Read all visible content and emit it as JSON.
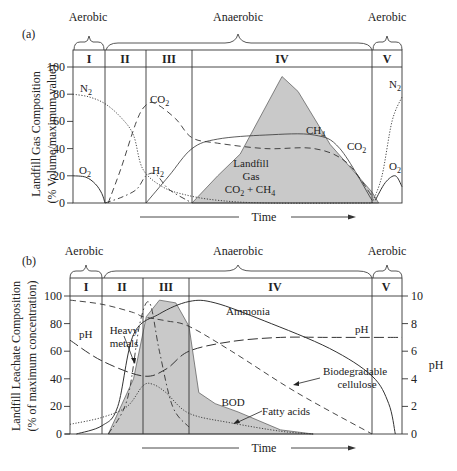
{
  "chart_data": [
    {
      "type": "line",
      "panel_label": "(a)",
      "title": "",
      "xlabel": "Time",
      "ylabel": "Landfill Gas Composition",
      "ylabel_sub": "(% Volume/maximum value)",
      "ylim": [
        0,
        100
      ],
      "yticks": [
        0,
        20,
        40,
        60,
        80,
        100
      ],
      "grid": false,
      "phases": [
        "I",
        "II",
        "III",
        "IV",
        "V"
      ],
      "phase_bounds": [
        0,
        1,
        2.3,
        3.7,
        9.3,
        10.2
      ],
      "regimes": [
        {
          "label": "Aerobic",
          "from": 0,
          "to": 1
        },
        {
          "label": "Anaerobic",
          "from": 1,
          "to": 9.3
        },
        {
          "label": "Aerobic",
          "from": 9.3,
          "to": 10.2
        }
      ],
      "x_units": "relative time (phase-scaled, 0–10.2)",
      "shaded_area": {
        "label": "Landfill Gas CO2 + CH4",
        "x": [
          3.7,
          4.5,
          5.2,
          6.5,
          7.0,
          8.0,
          9.3,
          9.5
        ],
        "y": [
          0,
          20,
          36,
          93,
          82,
          43,
          8,
          0
        ]
      },
      "series": [
        {
          "name": "N2",
          "style": "dotted",
          "x": [
            0,
            0.5,
            1.0,
            1.5,
            1.9,
            2.2,
            2.8,
            3.5,
            4.5,
            6,
            9.3
          ],
          "y": [
            80,
            78,
            73,
            63,
            50,
            25,
            12,
            6,
            2,
            0,
            0
          ]
        },
        {
          "name": "O2",
          "style": "solid",
          "x": [
            0,
            0.4,
            0.7,
            0.9,
            1.0
          ],
          "y": [
            20,
            19,
            14,
            7,
            0
          ]
        },
        {
          "name": "CO2",
          "style": "dashed",
          "x": [
            1.1,
            1.5,
            2.0,
            2.3,
            2.6,
            3.2,
            3.7,
            4.5,
            6.0,
            7.5,
            8.5,
            9.3
          ],
          "y": [
            0,
            25,
            60,
            72,
            73,
            62,
            48,
            44,
            40,
            40,
            30,
            5
          ]
        },
        {
          "name": "H2",
          "style": "dash-dot",
          "x": [
            1.0,
            1.5,
            2.0,
            2.3,
            2.6,
            3.0,
            3.7
          ],
          "y": [
            0,
            4,
            10,
            20,
            21,
            10,
            0
          ]
        },
        {
          "name": "CH4",
          "style": "solid-thin",
          "x": [
            2.3,
            3.0,
            3.7,
            4.5,
            6.0,
            7.5,
            8.3,
            9.3
          ],
          "y": [
            0,
            20,
            40,
            47,
            50,
            50,
            40,
            2
          ]
        },
        {
          "name": "N2 (Phase V)",
          "style": "dotted",
          "x": [
            9.3,
            9.6,
            9.9,
            10.2
          ],
          "y": [
            0,
            20,
            60,
            78
          ]
        },
        {
          "name": "O2 (Phase V)",
          "style": "solid",
          "x": [
            9.4,
            9.7,
            10.0,
            10.2
          ],
          "y": [
            2,
            15,
            20,
            12
          ]
        }
      ],
      "annotations": [
        "N2",
        "O2",
        "CO2",
        "H2",
        "CH4",
        "CO2",
        "N2",
        "O2",
        "Landfill",
        "Gas",
        "CO2 + CH4"
      ]
    },
    {
      "type": "line",
      "panel_label": "(b)",
      "title": "",
      "xlabel": "Time",
      "ylabel": "Landfill Leachate Composition",
      "ylabel_sub": "(% of maximum concentration)",
      "ylabel_right": "pH",
      "ylim": [
        0,
        100
      ],
      "ylim_right": [
        0,
        10
      ],
      "yticks": [
        0,
        20,
        40,
        60,
        80,
        100
      ],
      "yticks_right": [
        0,
        2,
        4,
        6,
        8,
        10
      ],
      "grid": false,
      "phases": [
        "I",
        "II",
        "III",
        "IV",
        "V"
      ],
      "phase_bounds": [
        0,
        1,
        2.3,
        3.7,
        9.3,
        10.2
      ],
      "regimes": [
        {
          "label": "Aerobic",
          "from": 0,
          "to": 1
        },
        {
          "label": "Anaerobic",
          "from": 1,
          "to": 9.3
        },
        {
          "label": "Aerobic",
          "from": 9.3,
          "to": 10.2
        }
      ],
      "shaded_area": {
        "label": "BOD",
        "x": [
          1.2,
          2.0,
          2.4,
          2.8,
          3.3,
          3.7,
          4.0,
          4.5,
          5.2,
          6.5,
          7.5
        ],
        "y": [
          0,
          40,
          85,
          97,
          95,
          78,
          30,
          22,
          16,
          3,
          0
        ]
      },
      "series": [
        {
          "name": "Ammonia",
          "style": "solid",
          "x": [
            0.2,
            1.0,
            1.5,
            2.0,
            2.8,
            3.7,
            4.5,
            6.0,
            8.0,
            9.3,
            9.8,
            10.0
          ],
          "y": [
            0,
            6,
            20,
            72,
            87,
            96,
            95,
            82,
            62,
            42,
            22,
            0
          ]
        },
        {
          "name": "pH (left scale 70→10 x10)",
          "style": "long-dash",
          "x": [
            0,
            1.0,
            2.3,
            3.0,
            3.7,
            5.0,
            6.5,
            8.0,
            10.2
          ],
          "y": [
            6.8,
            5.3,
            4.2,
            4.7,
            6.0,
            6.7,
            7.0,
            7.0,
            7.0
          ]
        },
        {
          "name": "Biodegradable cellulose",
          "style": "dashed",
          "x": [
            0,
            1.0,
            2.0,
            2.3,
            3.0,
            3.7,
            5.0,
            7.0,
            9.3
          ],
          "y": [
            97,
            94,
            88,
            85,
            82,
            78,
            60,
            30,
            0
          ]
        },
        {
          "name": "Heavy metals",
          "style": "dash-dot",
          "x": [
            1.2,
            1.8,
            2.2,
            2.5,
            2.8,
            3.2,
            3.7
          ],
          "y": [
            0,
            25,
            80,
            95,
            60,
            20,
            5
          ]
        },
        {
          "name": "Fatty acids",
          "style": "dotted",
          "x": [
            0,
            1.0,
            1.8,
            2.3,
            2.6,
            3.0,
            3.7,
            5.0,
            6.5,
            7.5
          ],
          "y": [
            7,
            12,
            20,
            35,
            36,
            30,
            15,
            8,
            2,
            0
          ]
        }
      ],
      "annotations": [
        "Ammonia",
        "pH",
        "pH",
        "Heavy metals",
        "Biodegradable cellulose",
        "BOD",
        "Fatty acids"
      ]
    }
  ],
  "labels": {
    "panel_a": "(a)",
    "panel_b": "(b)",
    "aerobic": "Aerobic",
    "anaerobic": "Anaerobic",
    "time": "Time",
    "ylabel_a1": "Landfill Gas Composition",
    "ylabel_a2": "(% Volume/maximum value)",
    "ylabel_b1": "Landfill Leachate Composition",
    "ylabel_b2": "(% of maximum concentration)",
    "ylabel_b_right": "pH",
    "phase_I": "I",
    "phase_II": "II",
    "phase_III": "III",
    "phase_IV": "IV",
    "phase_V": "V",
    "n2": "N",
    "o2": "O",
    "co2": "CO",
    "h2": "H",
    "ch4": "CH",
    "sub2": "2",
    "sub4": "4",
    "landfill": "Landfill",
    "gas": "Gas",
    "co2_plus_ch4_a": "CO",
    "co2_plus_ch4_b": " + CH",
    "ammonia": "Ammonia",
    "ph": "pH",
    "heavy": "Heavy",
    "metals": "metals",
    "biodeg": "Biodegradable",
    "cellulose": "cellulose",
    "bod": "BOD",
    "fatty": "Fatty acids",
    "y0": "0",
    "y20": "20",
    "y40": "40",
    "y60": "60",
    "y80": "80",
    "y100": "100",
    "r0": "0",
    "r2": "2",
    "r4": "4",
    "r6": "6",
    "r8": "8",
    "r10": "10"
  }
}
